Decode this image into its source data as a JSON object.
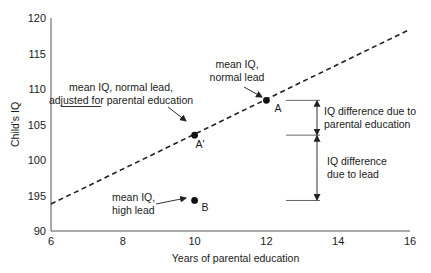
{
  "chart_data": {
    "type": "line",
    "title": "",
    "xlabel": "Years of parental education",
    "ylabel": "Child's IQ",
    "xlim": [
      6,
      16
    ],
    "ylim": [
      90,
      120
    ],
    "x_ticks": [
      6,
      8,
      10,
      12,
      14,
      16
    ],
    "x_tick_labels": [
      "6",
      "8",
      "10",
      "12",
      "14",
      "16"
    ],
    "y_ticks": [
      90,
      95,
      100,
      105,
      110,
      115,
      120
    ],
    "y_tick_labels": [
      "90",
      "195",
      "100",
      "105",
      "110",
      "115",
      "120"
    ],
    "grid": false,
    "series": [
      {
        "name": "mean IQ, normal lead (regression line)",
        "style": "dashed",
        "x": [
          6,
          16
        ],
        "y": [
          93.8,
          118.4
        ]
      }
    ],
    "points": [
      {
        "id": "A",
        "label": "A",
        "x": 12,
        "y": 108.4,
        "annotation": [
          "mean IQ,",
          "normal lead"
        ]
      },
      {
        "id": "A_prime",
        "label": "A′",
        "x": 10,
        "y": 103.5,
        "annotation": [
          "mean IQ, normal lead,",
          "adjusted for parental education"
        ],
        "underlined_word": "adjusted"
      },
      {
        "id": "B",
        "label": "B",
        "x": 10,
        "y": 94.3,
        "annotation": [
          "mean IQ,",
          "high lead"
        ]
      }
    ],
    "brackets": [
      {
        "from": 108.4,
        "to": 103.5,
        "label": [
          "IQ difference due to",
          "parental education"
        ]
      },
      {
        "from": 103.5,
        "to": 94.3,
        "label": [
          "IQ difference",
          "due to lead"
        ]
      }
    ]
  }
}
